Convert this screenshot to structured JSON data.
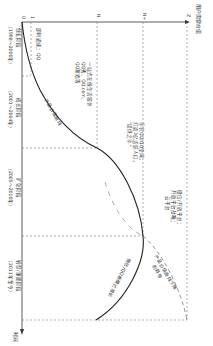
{
  "figure": {
    "orientation": "rotated-90-clockwise",
    "y_axis_label": "用户需要价值",
    "x_axis_label": "时间",
    "origin_label": "0",
    "value_levels": [
      "1",
      "N",
      "N+",
      "Z"
    ],
    "stages": [
      {
        "name": "创业阶段",
        "period": "（1998～2000年）"
      },
      {
        "name": "成长阶段",
        "period": "（2001～2004年）"
      },
      {
        "name": "扩张阶段",
        "period": "（2005～2010年）"
      },
      {
        "name": "转型/重建阶段",
        "period": "（2011年至今）"
      }
    ],
    "annotations": {
      "stage1": "即时通讯：QQ",
      "stage2_lines": [
        "一站式在线生活服务",
        "QQ秀、QQ.com、",
        "QQ游戏等"
      ],
      "stage3_lines": [
        "手机QQ/QQ空间，",
        "打造3亿活跃人口，",
        "“提供之手”"
      ],
      "stage4_lines": [
        "微信/开放平台；",
        "开放平台战略；",
        "云平台"
      ],
      "curve_label": "产品价值曲线",
      "decline_label": "微信/Q式新模式增长",
      "decline_label_lines": [
        "微信/QQ新模式增长"
      ],
      "dashed_curve_lines": [
        "产品价值曲线下降",
        "的趋势"
      ]
    },
    "colors": {
      "line": "#333333",
      "dashed": "#666666",
      "background": "#ffffff"
    }
  }
}
